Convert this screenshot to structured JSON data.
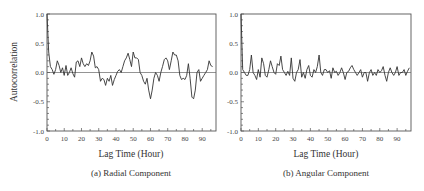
{
  "chart_data": [
    {
      "type": "line",
      "title": "",
      "caption": "(a) Radial Component",
      "xlabel": "Lag Time (Hour)",
      "ylabel": "Autocorrelation",
      "xlim": [
        0,
        98
      ],
      "ylim": [
        -1.0,
        1.0
      ],
      "x_ticks": [
        0,
        10,
        20,
        30,
        40,
        50,
        60,
        70,
        80,
        90
      ],
      "x_tick_labels": [
        "0",
        "10",
        "20",
        "30",
        "40",
        "50",
        "60",
        "70",
        "80",
        "90"
      ],
      "y_ticks": [
        1.0,
        0.5,
        0.0,
        -0.5,
        -1.0
      ],
      "y_tick_labels": [
        "1.0",
        "0.5",
        "0.0",
        "-0.5",
        "-1.0"
      ],
      "zero_line": true,
      "grid": false,
      "series": [
        {
          "name": "Radial autocorrelation",
          "x": [
            0,
            1,
            2,
            3,
            4,
            5,
            6,
            7,
            8,
            9,
            10,
            11,
            12,
            13,
            14,
            15,
            16,
            17,
            18,
            19,
            20,
            21,
            22,
            23,
            24,
            25,
            26,
            27,
            28,
            29,
            30,
            31,
            32,
            33,
            34,
            35,
            36,
            37,
            38,
            39,
            40,
            41,
            42,
            43,
            44,
            45,
            46,
            47,
            48,
            49,
            50,
            51,
            52,
            53,
            54,
            55,
            56,
            57,
            58,
            59,
            60,
            61,
            62,
            63,
            64,
            65,
            66,
            67,
            68,
            69,
            70,
            71,
            72,
            73,
            74,
            75,
            76,
            77,
            78,
            79,
            80,
            81,
            82,
            83,
            84,
            85,
            86,
            87,
            88,
            89,
            90,
            91,
            92,
            93,
            94,
            95,
            96
          ],
          "values": [
            1.0,
            0.35,
            0.1,
            0.05,
            -0.03,
            0.05,
            0.2,
            0.12,
            0.0,
            0.08,
            -0.05,
            0.12,
            -0.05,
            0.0,
            0.08,
            -0.02,
            -0.08,
            0.18,
            0.2,
            0.1,
            0.25,
            0.15,
            0.1,
            0.15,
            0.12,
            0.2,
            0.35,
            0.28,
            0.08,
            0.1,
            0.05,
            -0.15,
            -0.1,
            -0.12,
            -0.22,
            -0.1,
            -0.15,
            -0.05,
            -0.22,
            -0.12,
            -0.05,
            0.02,
            0.05,
            0.0,
            0.1,
            0.2,
            0.25,
            0.33,
            0.22,
            0.1,
            0.35,
            0.25,
            0.25,
            0.22,
            0.0,
            -0.05,
            -0.15,
            -0.2,
            -0.1,
            -0.3,
            -0.45,
            -0.3,
            -0.1,
            0.0,
            -0.05,
            -0.15,
            0.0,
            0.1,
            0.22,
            0.25,
            0.2,
            0.05,
            0.2,
            0.35,
            0.3,
            0.3,
            0.2,
            -0.05,
            -0.12,
            -0.1,
            -0.12,
            -0.05,
            0.15,
            -0.1,
            -0.42,
            -0.45,
            -0.3,
            0.0,
            0.05,
            -0.15,
            -0.1,
            -0.05,
            0.0,
            0.05,
            0.2,
            0.12,
            0.1
          ]
        }
      ]
    },
    {
      "type": "line",
      "title": "",
      "caption": "(b) Angular Component",
      "xlabel": "Lag Time (Hour)",
      "ylabel": "",
      "xlim": [
        0,
        98
      ],
      "ylim": [
        -1.0,
        1.0
      ],
      "x_ticks": [
        0,
        10,
        20,
        30,
        40,
        50,
        60,
        70,
        80,
        90
      ],
      "x_tick_labels": [
        "0",
        "10",
        "20",
        "30",
        "40",
        "50",
        "60",
        "70",
        "80",
        "90"
      ],
      "y_ticks": [
        1.0,
        0.5,
        0.0,
        -0.5,
        -1.0
      ],
      "y_tick_labels": [
        "1.0",
        "0.5",
        "0.0",
        "-0.5",
        "-1.0"
      ],
      "zero_line": true,
      "grid": false,
      "series": [
        {
          "name": "Angular autocorrelation",
          "x": [
            0,
            1,
            2,
            3,
            4,
            5,
            6,
            7,
            8,
            9,
            10,
            11,
            12,
            13,
            14,
            15,
            16,
            17,
            18,
            19,
            20,
            21,
            22,
            23,
            24,
            25,
            26,
            27,
            28,
            29,
            30,
            31,
            32,
            33,
            34,
            35,
            36,
            37,
            38,
            39,
            40,
            41,
            42,
            43,
            44,
            45,
            46,
            47,
            48,
            49,
            50,
            51,
            52,
            53,
            54,
            55,
            56,
            57,
            58,
            59,
            60,
            61,
            62,
            63,
            64,
            65,
            66,
            67,
            68,
            69,
            70,
            71,
            72,
            73,
            74,
            75,
            76,
            77,
            78,
            79,
            80,
            81,
            82,
            83,
            84,
            85,
            86,
            87,
            88,
            89,
            90,
            91,
            92,
            93,
            94,
            95,
            96,
            97
          ],
          "values": [
            1.0,
            0.05,
            0.0,
            -0.05,
            -0.05,
            0.05,
            0.3,
            0.0,
            -0.05,
            -0.12,
            0.05,
            -0.08,
            0.25,
            0.15,
            -0.05,
            -0.08,
            0.05,
            0.2,
            0.1,
            0.0,
            -0.03,
            0.15,
            0.12,
            0.28,
            0.05,
            0.0,
            -0.05,
            0.02,
            -0.05,
            0.25,
            -0.1,
            -0.15,
            0.0,
            0.05,
            0.22,
            -0.08,
            0.0,
            -0.1,
            0.05,
            0.12,
            -0.05,
            -0.08,
            0.05,
            0.0,
            0.1,
            0.3,
            0.0,
            -0.05,
            0.05,
            0.05,
            0.0,
            0.03,
            -0.1,
            0.08,
            0.0,
            0.02,
            -0.05,
            0.0,
            0.08,
            0.0,
            -0.12,
            0.0,
            0.02,
            0.08,
            0.12,
            0.05,
            0.0,
            -0.05,
            0.0,
            0.05,
            -0.08,
            0.0,
            0.0,
            -0.15,
            0.0,
            0.05,
            -0.05,
            0.0,
            -0.05,
            0.05,
            0.0,
            0.03,
            0.1,
            -0.05,
            -0.15,
            0.0,
            0.08,
            0.0,
            -0.05,
            0.0,
            0.1,
            -0.05,
            0.0,
            0.0,
            0.05,
            -0.05,
            0.02,
            0.08
          ]
        }
      ]
    }
  ]
}
